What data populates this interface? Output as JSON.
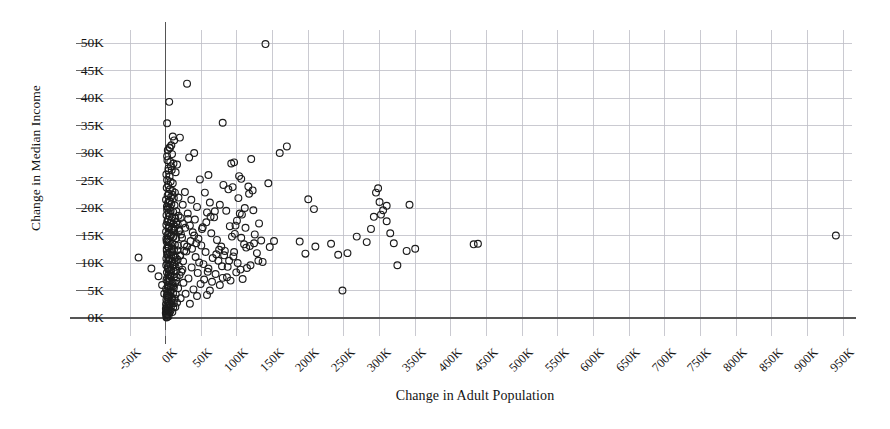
{
  "chart_data": {
    "type": "scatter",
    "title": "",
    "xlabel": "Change in Adult Population",
    "ylabel": "Change in Median Income",
    "xlim": [
      -50000,
      950000
    ],
    "ylim": [
      0,
      50000
    ],
    "grid": true,
    "legend": "none",
    "xtick_labels": [
      "-50K",
      "0K",
      "50K",
      "100K",
      "150K",
      "200K",
      "250K",
      "300K",
      "350K",
      "400K",
      "450K",
      "500K",
      "550K",
      "600K",
      "650K",
      "700K",
      "750K",
      "800K",
      "850K",
      "900K",
      "950K"
    ],
    "xtick_values": [
      -50000,
      0,
      50000,
      100000,
      150000,
      200000,
      250000,
      300000,
      350000,
      400000,
      450000,
      500000,
      550000,
      600000,
      650000,
      700000,
      750000,
      800000,
      850000,
      900000,
      950000
    ],
    "ytick_labels": [
      "0K",
      "5K",
      "10K",
      "15K",
      "20K",
      "25K",
      "30K",
      "35K",
      "40K",
      "45K",
      "50K"
    ],
    "ytick_values": [
      0,
      5000,
      10000,
      15000,
      20000,
      25000,
      30000,
      35000,
      40000,
      45000,
      50000
    ],
    "marker": {
      "shape": "circle-open",
      "size": 4.2,
      "color": "#1c1c1c",
      "fill": "none"
    },
    "axis_color": "#555555",
    "grid_color": "#bdbdc6",
    "background": "#ffffff",
    "points": [
      [
        140000,
        49800
      ],
      [
        30000,
        42600
      ],
      [
        5000,
        39300
      ],
      [
        80000,
        35500
      ],
      [
        2000,
        35400
      ],
      [
        160000,
        30000
      ],
      [
        170000,
        31200
      ],
      [
        20000,
        32800
      ],
      [
        12000,
        32300
      ],
      [
        8000,
        31400
      ],
      [
        6000,
        30900
      ],
      [
        3000,
        30500
      ],
      [
        9000,
        29800
      ],
      [
        40000,
        30000
      ],
      [
        33000,
        29200
      ],
      [
        2500,
        28700
      ],
      [
        6500,
        28400
      ],
      [
        11000,
        28100
      ],
      [
        16000,
        27900
      ],
      [
        120000,
        28900
      ],
      [
        96000,
        28300
      ],
      [
        92000,
        28100
      ],
      [
        4000,
        27200
      ],
      [
        8500,
        26900
      ],
      [
        14000,
        26500
      ],
      [
        1000,
        26100
      ],
      [
        5500,
        25700
      ],
      [
        60000,
        26000
      ],
      [
        103000,
        25800
      ],
      [
        106000,
        25300
      ],
      [
        2000,
        25100
      ],
      [
        7000,
        24800
      ],
      [
        10000,
        24500
      ],
      [
        3500,
        24200
      ],
      [
        48000,
        25200
      ],
      [
        81000,
        24200
      ],
      [
        144000,
        24500
      ],
      [
        116000,
        23900
      ],
      [
        122000,
        23200
      ],
      [
        1500,
        23700
      ],
      [
        6000,
        23400
      ],
      [
        9500,
        23100
      ],
      [
        13000,
        22800
      ],
      [
        4500,
        22600
      ],
      [
        27000,
        22900
      ],
      [
        55000,
        22800
      ],
      [
        88000,
        23400
      ],
      [
        94000,
        23800
      ],
      [
        2800,
        22300
      ],
      [
        7500,
        22000
      ],
      [
        11500,
        21800
      ],
      [
        500,
        21500
      ],
      [
        5000,
        21300
      ],
      [
        18000,
        21900
      ],
      [
        36000,
        21500
      ],
      [
        62000,
        21000
      ],
      [
        200000,
        21600
      ],
      [
        295000,
        22800
      ],
      [
        300000,
        21100
      ],
      [
        3200,
        20900
      ],
      [
        8000,
        20700
      ],
      [
        12500,
        20500
      ],
      [
        1800,
        20300
      ],
      [
        6200,
        20100
      ],
      [
        24000,
        20600
      ],
      [
        44000,
        20200
      ],
      [
        76000,
        20600
      ],
      [
        208000,
        19800
      ],
      [
        310000,
        20400
      ],
      [
        2000,
        19700
      ],
      [
        7000,
        19500
      ],
      [
        10500,
        19300
      ],
      [
        4000,
        19100
      ],
      [
        15000,
        19400
      ],
      [
        31000,
        19000
      ],
      [
        58000,
        19200
      ],
      [
        85000,
        19500
      ],
      [
        104000,
        19000
      ],
      [
        302000,
        18800
      ],
      [
        1200,
        18700
      ],
      [
        5500,
        18500
      ],
      [
        9000,
        18300
      ],
      [
        13500,
        18100
      ],
      [
        3000,
        17900
      ],
      [
        21000,
        18200
      ],
      [
        41000,
        17900
      ],
      [
        68000,
        18300
      ],
      [
        100000,
        17700
      ],
      [
        310000,
        17600
      ],
      [
        2200,
        17500
      ],
      [
        6800,
        17300
      ],
      [
        11000,
        17100
      ],
      [
        1000,
        16900
      ],
      [
        4800,
        16700
      ],
      [
        17000,
        17000
      ],
      [
        34000,
        16800
      ],
      [
        52000,
        16500
      ],
      [
        90000,
        16700
      ],
      [
        112000,
        16400
      ],
      [
        3800,
        16300
      ],
      [
        8200,
        16100
      ],
      [
        12000,
        15900
      ],
      [
        600,
        15700
      ],
      [
        5200,
        15500
      ],
      [
        19000,
        15800
      ],
      [
        38000,
        15600
      ],
      [
        64000,
        15400
      ],
      [
        97000,
        15300
      ],
      [
        125000,
        15200
      ],
      [
        940000,
        15000
      ],
      [
        2600,
        15100
      ],
      [
        7200,
        14900
      ],
      [
        10200,
        14700
      ],
      [
        14500,
        14500
      ],
      [
        3400,
        14300
      ],
      [
        23000,
        14600
      ],
      [
        46000,
        14400
      ],
      [
        72000,
        14200
      ],
      [
        106000,
        14600
      ],
      [
        134000,
        14100
      ],
      [
        152000,
        14000
      ],
      [
        188000,
        13900
      ],
      [
        232000,
        13500
      ],
      [
        282000,
        13800
      ],
      [
        320000,
        13600
      ],
      [
        432000,
        13400
      ],
      [
        438000,
        13500
      ],
      [
        1400,
        13900
      ],
      [
        6000,
        13700
      ],
      [
        9600,
        13500
      ],
      [
        13000,
        13300
      ],
      [
        2800,
        13100
      ],
      [
        26000,
        13400
      ],
      [
        50000,
        13200
      ],
      [
        78000,
        13000
      ],
      [
        110000,
        13400
      ],
      [
        118000,
        13100
      ],
      [
        146000,
        12900
      ],
      [
        350000,
        12600
      ],
      [
        4200,
        12800
      ],
      [
        8800,
        12600
      ],
      [
        11800,
        12400
      ],
      [
        1600,
        12200
      ],
      [
        5800,
        12000
      ],
      [
        16500,
        12300
      ],
      [
        29000,
        12100
      ],
      [
        56000,
        12000
      ],
      [
        83000,
        12200
      ],
      [
        128000,
        11800
      ],
      [
        196000,
        11700
      ],
      [
        242000,
        11500
      ],
      [
        3000,
        11600
      ],
      [
        7600,
        11400
      ],
      [
        10800,
        11200
      ],
      [
        14000,
        11000
      ],
      [
        2000,
        11500
      ],
      [
        20000,
        11300
      ],
      [
        42000,
        11100
      ],
      [
        66000,
        10900
      ],
      [
        95000,
        11200
      ],
      [
        -38000,
        11000
      ],
      [
        1000,
        10800
      ],
      [
        5000,
        10600
      ],
      [
        9200,
        10400
      ],
      [
        12600,
        10200
      ],
      [
        3600,
        10500
      ],
      [
        24500,
        10300
      ],
      [
        47000,
        10100
      ],
      [
        74000,
        10400
      ],
      [
        101000,
        10000
      ],
      [
        136000,
        10200
      ],
      [
        2400,
        9900
      ],
      [
        6600,
        9700
      ],
      [
        10000,
        9500
      ],
      [
        13800,
        9300
      ],
      [
        800,
        9600
      ],
      [
        18500,
        9400
      ],
      [
        36500,
        9200
      ],
      [
        60000,
        9000
      ],
      [
        87000,
        9300
      ],
      [
        114000,
        9100
      ],
      [
        3200,
        8900
      ],
      [
        7800,
        8700
      ],
      [
        11200,
        8500
      ],
      [
        1800,
        8300
      ],
      [
        5400,
        8600
      ],
      [
        22000,
        8400
      ],
      [
        45000,
        8200
      ],
      [
        70000,
        8000
      ],
      [
        99000,
        8300
      ],
      [
        4000,
        7900
      ],
      [
        8400,
        7700
      ],
      [
        12200,
        7500
      ],
      [
        2200,
        7300
      ],
      [
        6200,
        7600
      ],
      [
        15500,
        7400
      ],
      [
        32000,
        7200
      ],
      [
        54000,
        7000
      ],
      [
        80000,
        7300
      ],
      [
        108000,
        7100
      ],
      [
        1200,
        6900
      ],
      [
        5600,
        6700
      ],
      [
        9800,
        6500
      ],
      [
        13200,
        6300
      ],
      [
        2600,
        6600
      ],
      [
        25000,
        6400
      ],
      [
        49000,
        6200
      ],
      [
        76000,
        6000
      ],
      [
        3000,
        5900
      ],
      [
        7000,
        5700
      ],
      [
        11600,
        5500
      ],
      [
        600,
        5300
      ],
      [
        4600,
        5600
      ],
      [
        17500,
        5400
      ],
      [
        39000,
        5200
      ],
      [
        62000,
        5000
      ],
      [
        248000,
        5000
      ],
      [
        2000,
        4900
      ],
      [
        6400,
        4700
      ],
      [
        10400,
        4500
      ],
      [
        14200,
        4300
      ],
      [
        3400,
        4600
      ],
      [
        28000,
        4400
      ],
      [
        58000,
        4200
      ],
      [
        1600,
        4100
      ],
      [
        5000,
        3900
      ],
      [
        9000,
        3700
      ],
      [
        12800,
        3500
      ],
      [
        2800,
        3800
      ],
      [
        21000,
        3600
      ],
      [
        44000,
        4000
      ],
      [
        1000,
        3300
      ],
      [
        4400,
        3100
      ],
      [
        8000,
        2900
      ],
      [
        11400,
        2700
      ],
      [
        2200,
        3000
      ],
      [
        16000,
        2800
      ],
      [
        34000,
        2600
      ],
      [
        500,
        2500
      ],
      [
        3800,
        2300
      ],
      [
        7400,
        2100
      ],
      [
        10600,
        1900
      ],
      [
        1800,
        2200
      ],
      [
        13600,
        2000
      ],
      [
        300,
        1700
      ],
      [
        3200,
        1500
      ],
      [
        6800,
        1300
      ],
      [
        9400,
        1100
      ],
      [
        1400,
        1400
      ],
      [
        5200,
        900
      ],
      [
        2600,
        700
      ],
      [
        800,
        500
      ],
      [
        4000,
        300
      ],
      [
        2000,
        200
      ],
      [
        1200,
        100
      ],
      [
        200,
        900
      ],
      [
        2400,
        1800
      ],
      [
        6000,
        2400
      ],
      [
        1600,
        600
      ],
      [
        3600,
        1200
      ],
      [
        8600,
        3300
      ],
      [
        4800,
        2700
      ],
      [
        2800,
        4200
      ],
      [
        7200,
        4800
      ],
      [
        10800,
        5800
      ],
      [
        15000,
        6800
      ],
      [
        19500,
        7800
      ],
      [
        23500,
        8800
      ],
      [
        5000,
        16500
      ],
      [
        8000,
        17800
      ],
      [
        3000,
        20000
      ],
      [
        6000,
        21200
      ],
      [
        9500,
        22400
      ],
      [
        4000,
        26800
      ],
      [
        7500,
        27600
      ],
      [
        2000,
        29400
      ],
      [
        5500,
        31000
      ],
      [
        10000,
        33000
      ],
      [
        1500,
        12600
      ],
      [
        4200,
        13800
      ],
      [
        7800,
        15200
      ],
      [
        11000,
        16200
      ],
      [
        14800,
        17400
      ],
      [
        18000,
        18600
      ],
      [
        2200,
        14200
      ],
      [
        5800,
        10800
      ],
      [
        9200,
        12000
      ],
      [
        12400,
        9800
      ],
      [
        16800,
        10600
      ],
      [
        20500,
        11400
      ],
      [
        26000,
        12200
      ],
      [
        30000,
        13000
      ],
      [
        35000,
        14000
      ],
      [
        40000,
        15000
      ],
      [
        51000,
        16200
      ],
      [
        57000,
        17400
      ],
      [
        63000,
        18400
      ],
      [
        69000,
        19400
      ],
      [
        75000,
        12400
      ],
      [
        82000,
        11400
      ],
      [
        89000,
        10400
      ],
      [
        93000,
        14800
      ],
      [
        98000,
        16800
      ],
      [
        102000,
        21800
      ],
      [
        107000,
        18800
      ],
      [
        113000,
        12800
      ],
      [
        119000,
        9600
      ],
      [
        124000,
        13600
      ],
      [
        130000,
        10400
      ],
      [
        -20000,
        9000
      ],
      [
        -10000,
        7600
      ],
      [
        -5000,
        6000
      ],
      [
        -2000,
        4400
      ],
      [
        1000,
        14400
      ],
      [
        3000,
        9200
      ],
      [
        5000,
        7200
      ],
      [
        7000,
        8000
      ],
      [
        9000,
        6200
      ],
      [
        11000,
        14800
      ],
      [
        13000,
        16600
      ],
      [
        15000,
        8600
      ],
      [
        17000,
        13200
      ],
      [
        19000,
        16000
      ],
      [
        21500,
        15200
      ],
      [
        24000,
        17200
      ],
      [
        27500,
        16400
      ],
      [
        31500,
        18000
      ],
      [
        37000,
        12600
      ],
      [
        43000,
        13600
      ],
      [
        53000,
        9800
      ],
      [
        59000,
        8400
      ],
      [
        65000,
        6600
      ],
      [
        71000,
        11600
      ],
      [
        79000,
        9400
      ],
      [
        86000,
        7400
      ],
      [
        91000,
        6800
      ],
      [
        96000,
        12000
      ],
      [
        105000,
        8800
      ],
      [
        111000,
        20000
      ],
      [
        117000,
        22600
      ],
      [
        123000,
        19600
      ],
      [
        131000,
        17200
      ],
      [
        210000,
        13000
      ],
      [
        255000,
        11800
      ],
      [
        268000,
        14800
      ],
      [
        288000,
        16200
      ],
      [
        292000,
        18400
      ],
      [
        298000,
        23600
      ],
      [
        305000,
        19600
      ],
      [
        315000,
        15400
      ],
      [
        325000,
        9600
      ],
      [
        338000,
        12200
      ],
      [
        342000,
        20600
      ]
    ]
  },
  "axes": {
    "zero_line_x_label": "0K",
    "zero_line_y_label": "0K"
  }
}
